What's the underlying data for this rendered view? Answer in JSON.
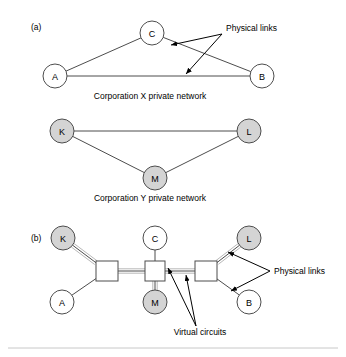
{
  "figure": {
    "panels": [
      {
        "id": "a",
        "label": "(a)",
        "label_x": 31,
        "label_y": 30,
        "captions": [
          {
            "name": "corp-x-caption",
            "text": "Corporation X private network",
            "x": 150,
            "y": 99
          },
          {
            "name": "corp-y-caption",
            "text": "Corporation Y private network",
            "x": 150,
            "y": 201
          }
        ],
        "networks": [
          {
            "name": "corporation-x-network",
            "nodes": [
              {
                "id": "A",
                "label": "A",
                "cx": 55,
                "cy": 76,
                "r": 12,
                "fill": "white"
              },
              {
                "id": "C",
                "label": "C",
                "cx": 152,
                "cy": 33,
                "r": 12,
                "fill": "white"
              },
              {
                "id": "B",
                "label": "B",
                "cx": 262,
                "cy": 76,
                "r": 12,
                "fill": "white"
              }
            ],
            "links": [
              {
                "from": "A",
                "to": "C"
              },
              {
                "from": "C",
                "to": "B"
              },
              {
                "from": "A",
                "to": "B"
              }
            ]
          },
          {
            "name": "corporation-y-network",
            "nodes": [
              {
                "id": "K",
                "label": "K",
                "cx": 62,
                "cy": 131,
                "r": 12,
                "fill": "gray"
              },
              {
                "id": "L",
                "label": "L",
                "cx": 249,
                "cy": 131,
                "r": 12,
                "fill": "gray"
              },
              {
                "id": "M",
                "label": "M",
                "cx": 155,
                "cy": 178,
                "r": 12,
                "fill": "gray"
              }
            ],
            "links": [
              {
                "from": "K",
                "to": "L"
              },
              {
                "from": "K",
                "to": "M"
              },
              {
                "from": "M",
                "to": "L"
              }
            ]
          }
        ],
        "annotations": [
          {
            "name": "physical-links-annotation-a",
            "text": "Physical links",
            "text_x": 226,
            "text_y": 31,
            "origin_x": 222,
            "origin_y": 34,
            "arrows": [
              {
                "tip_x": 171,
                "tip_y": 45
              },
              {
                "tip_x": 186,
                "tip_y": 74
              }
            ]
          }
        ]
      },
      {
        "id": "b",
        "label": "(b)",
        "label_x": 31,
        "label_y": 241,
        "networks": [
          {
            "name": "combined-switched-network",
            "nodes": [
              {
                "id": "Kb",
                "label": "K",
                "cx": 63,
                "cy": 238,
                "r": 12,
                "fill": "gray"
              },
              {
                "id": "Ab",
                "label": "A",
                "cx": 62,
                "cy": 302,
                "r": 12,
                "fill": "white"
              },
              {
                "id": "Cb",
                "label": "C",
                "cx": 155,
                "cy": 238,
                "r": 12,
                "fill": "white"
              },
              {
                "id": "Mb",
                "label": "M",
                "cx": 155,
                "cy": 302,
                "r": 12,
                "fill": "gray"
              },
              {
                "id": "Lb",
                "label": "L",
                "cx": 249,
                "cy": 238,
                "r": 12,
                "fill": "gray"
              },
              {
                "id": "Bb",
                "label": "B",
                "cx": 249,
                "cy": 302,
                "r": 12,
                "fill": "white"
              }
            ],
            "switches": [
              {
                "id": "S1",
                "x": 96,
                "y": 261,
                "w": 22,
                "h": 20
              },
              {
                "id": "S2",
                "x": 145,
                "y": 261,
                "w": 20,
                "h": 20
              },
              {
                "id": "S3",
                "x": 195,
                "y": 261,
                "w": 22,
                "h": 20
              }
            ],
            "physical_links": [
              {
                "from": "Kb",
                "to": "S1"
              },
              {
                "from": "Ab",
                "to": "S1"
              },
              {
                "from": "Cb",
                "to": "S2"
              },
              {
                "from": "Mb",
                "to": "S2"
              },
              {
                "from": "Lb",
                "to": "S3"
              },
              {
                "from": "Bb",
                "to": "S3"
              },
              {
                "from": "S1",
                "to": "S2"
              },
              {
                "from": "S2",
                "to": "S3"
              }
            ],
            "virtual_circuits": [
              {
                "from": "Kb",
                "to": "S1"
              },
              {
                "from": "S1",
                "to": "S2"
              },
              {
                "from": "S2",
                "to": "Mb"
              },
              {
                "from": "S2",
                "to": "S3"
              },
              {
                "from": "S3",
                "to": "Lb"
              }
            ]
          }
        ],
        "annotations": [
          {
            "name": "physical-links-annotation-b",
            "text": "Physical links",
            "text_x": 274,
            "text_y": 274,
            "origin_x": 270,
            "origin_y": 271,
            "arrows": [
              {
                "tip_x": 228,
                "tip_y": 252
              },
              {
                "tip_x": 231,
                "tip_y": 291
              }
            ]
          },
          {
            "name": "virtual-circuits-annotation",
            "text": "Virtual circuits",
            "text_x": 200,
            "text_y": 335,
            "origin_x": 196,
            "origin_y": 326,
            "arrows": [
              {
                "tip_x": 168,
                "tip_y": 268
              },
              {
                "tip_x": 186,
                "tip_y": 275
              }
            ]
          }
        ]
      }
    ],
    "footer_rule": {
      "x1": 8,
      "y1": 348,
      "x2": 338,
      "y2": 348
    }
  },
  "colors": {
    "stroke": "#4d4d4d",
    "node_gray": "#d4d4d4",
    "node_white": "#ffffff",
    "virtual_circuit": "#b8b8b8",
    "annotation": "#000000",
    "background": "#ffffff"
  }
}
